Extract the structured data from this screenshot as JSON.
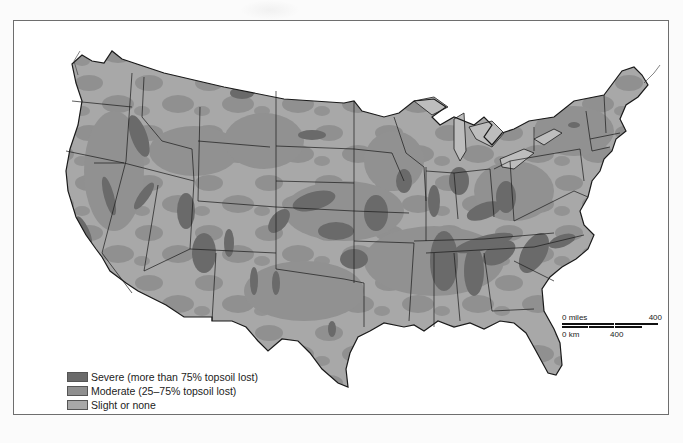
{
  "map": {
    "subject": "Contiguous United States topsoil erosion",
    "colors": {
      "severe": "#6a6a6a",
      "moderate": "#8f8f8f",
      "slight": "#a8a8a8",
      "border": "#1a1a1a",
      "water": "#ffffff",
      "lakes": "#bdbdbd"
    }
  },
  "legend": {
    "items": [
      {
        "label": "Severe (more than 75% topsoil lost)",
        "color": "#6a6a6a"
      },
      {
        "label": "Moderate (25–75% topsoil lost)",
        "color": "#8f8f8f"
      },
      {
        "label": "Slight or none",
        "color": "#a8a8a8"
      }
    ]
  },
  "scale_bar": {
    "miles_start": "0 miles",
    "miles_end": "400",
    "km_start": "0 km",
    "km_end": "400"
  }
}
